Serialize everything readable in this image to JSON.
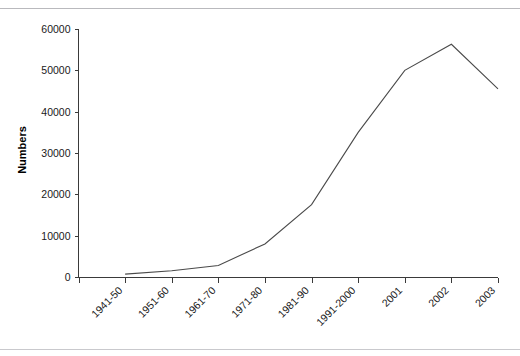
{
  "chart_data": {
    "type": "line",
    "title": "",
    "subtitle": "",
    "xlabel": "",
    "ylabel": "Numbers",
    "categories": [
      "1941-50",
      "1951-60",
      "1961-70",
      "1971-80",
      "1981-90",
      "1991-2000",
      "2001",
      "2002",
      "2003"
    ],
    "values": [
      700,
      1500,
      2800,
      8000,
      17500,
      35000,
      50000,
      56300,
      45500
    ],
    "series": [
      {
        "name": "Numbers",
        "values": [
          700,
          1500,
          2800,
          8000,
          17500,
          35000,
          50000,
          56300,
          45500
        ]
      }
    ],
    "ylim": [
      0,
      60000
    ],
    "y_ticks": [
      0,
      10000,
      20000,
      30000,
      40000,
      50000,
      60000
    ],
    "y_tick_labels": [
      "0",
      "10000",
      "20000",
      "30000",
      "40000",
      "50000",
      "60000"
    ],
    "grid": false,
    "legend": "none",
    "x_tick_label_rotation": 45,
    "line_color": "#4a4a4a",
    "axis_color": "#3a3a3a",
    "background_color": "#ffffff"
  }
}
